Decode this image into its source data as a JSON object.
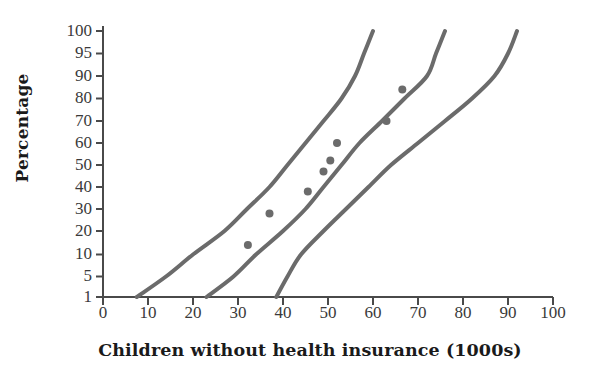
{
  "chart_data": {
    "type": "scatter",
    "title": "",
    "xlabel": "Children without health insurance (1000s)",
    "ylabel": "Percentage",
    "xlim": [
      0,
      100
    ],
    "xticks": [
      0,
      10,
      20,
      30,
      40,
      50,
      60,
      70,
      80,
      90,
      100
    ],
    "yticks": [
      1,
      5,
      10,
      20,
      30,
      40,
      50,
      60,
      70,
      80,
      90,
      95,
      100
    ],
    "yscale": "probit",
    "grid": false,
    "legend": null,
    "series": [
      {
        "name": "observed-points",
        "type": "scatter",
        "marker": "filled-circle",
        "color": "#6b6b6b",
        "points": [
          {
            "x": 32.2,
            "y": 14
          },
          {
            "x": 37.0,
            "y": 28
          },
          {
            "x": 45.5,
            "y": 38
          },
          {
            "x": 49.0,
            "y": 47
          },
          {
            "x": 50.5,
            "y": 52
          },
          {
            "x": 52.0,
            "y": 60
          },
          {
            "x": 63.0,
            "y": 70
          },
          {
            "x": 66.5,
            "y": 84
          }
        ]
      },
      {
        "name": "lower-confidence-band",
        "type": "line",
        "color": "#6b6b6b",
        "points": [
          {
            "x": 7.5,
            "y": 1
          },
          {
            "x": 14,
            "y": 5
          },
          {
            "x": 20,
            "y": 10
          },
          {
            "x": 27,
            "y": 20
          },
          {
            "x": 32,
            "y": 30
          },
          {
            "x": 37,
            "y": 40
          },
          {
            "x": 41,
            "y": 50
          },
          {
            "x": 45,
            "y": 60
          },
          {
            "x": 49,
            "y": 70
          },
          {
            "x": 53,
            "y": 80
          },
          {
            "x": 56,
            "y": 90
          },
          {
            "x": 58,
            "y": 95
          },
          {
            "x": 60,
            "y": 100
          }
        ]
      },
      {
        "name": "fitted-line",
        "type": "line",
        "color": "#6b6b6b",
        "points": [
          {
            "x": 23,
            "y": 1
          },
          {
            "x": 29,
            "y": 5
          },
          {
            "x": 34,
            "y": 10
          },
          {
            "x": 40,
            "y": 20
          },
          {
            "x": 45,
            "y": 30
          },
          {
            "x": 49,
            "y": 40
          },
          {
            "x": 53,
            "y": 50
          },
          {
            "x": 57,
            "y": 60
          },
          {
            "x": 62,
            "y": 70
          },
          {
            "x": 67,
            "y": 80
          },
          {
            "x": 72,
            "y": 90
          },
          {
            "x": 74,
            "y": 95
          },
          {
            "x": 76,
            "y": 100
          }
        ]
      },
      {
        "name": "upper-confidence-band",
        "type": "line",
        "color": "#6b6b6b",
        "points": [
          {
            "x": 38.5,
            "y": 1
          },
          {
            "x": 41,
            "y": 5
          },
          {
            "x": 44,
            "y": 10
          },
          {
            "x": 49,
            "y": 20
          },
          {
            "x": 54,
            "y": 30
          },
          {
            "x": 59,
            "y": 40
          },
          {
            "x": 64,
            "y": 50
          },
          {
            "x": 70,
            "y": 60
          },
          {
            "x": 76,
            "y": 70
          },
          {
            "x": 82,
            "y": 80
          },
          {
            "x": 87,
            "y": 90
          },
          {
            "x": 90,
            "y": 95
          },
          {
            "x": 92,
            "y": 100
          }
        ]
      }
    ]
  },
  "axes": {
    "y_title": "Percentage",
    "x_title": "Children without health insurance (1000s)",
    "y_tick_labels": [
      "100",
      "95",
      "90",
      "80",
      "70",
      "60",
      "50",
      "40",
      "30",
      "20",
      "10",
      "5",
      "1"
    ],
    "x_tick_labels": [
      "0",
      "10",
      "20",
      "30",
      "40",
      "50",
      "60",
      "70",
      "80",
      "90",
      "100"
    ]
  },
  "colors": {
    "curve": "#6b6b6b",
    "point": "#707070",
    "axis": "#4a4a4a",
    "text": "#1a1a1a",
    "background": "#ffffff"
  }
}
